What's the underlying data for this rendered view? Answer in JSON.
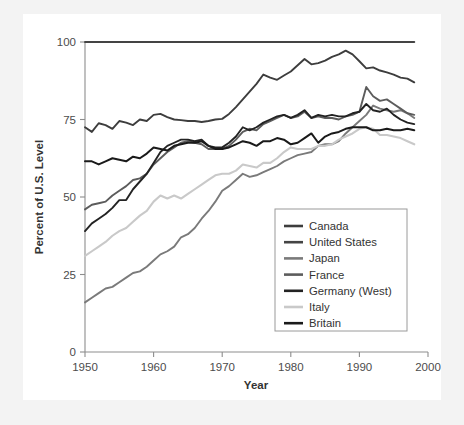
{
  "chart_data": {
    "type": "line",
    "title": "",
    "xlabel": "Year",
    "ylabel": "Percent of U.S. Level",
    "xlim": [
      1950,
      2000
    ],
    "ylim": [
      0,
      100
    ],
    "xticks": [
      1950,
      1960,
      1970,
      1980,
      1990,
      2000
    ],
    "xtick_labels": [
      "1950",
      "1960",
      "1970",
      "1980",
      "1990",
      "2000"
    ],
    "yticks": [
      0,
      25,
      50,
      75,
      100
    ],
    "ytick_labels": [
      "0",
      "25",
      "50",
      "75",
      "100"
    ],
    "grid": false,
    "legend_position": "lower-right-inside",
    "x": [
      1950,
      1951,
      1952,
      1953,
      1954,
      1955,
      1956,
      1957,
      1958,
      1959,
      1960,
      1961,
      1962,
      1963,
      1964,
      1965,
      1966,
      1967,
      1968,
      1969,
      1970,
      1971,
      1972,
      1973,
      1974,
      1975,
      1976,
      1977,
      1978,
      1979,
      1980,
      1981,
      1982,
      1983,
      1984,
      1985,
      1986,
      1987,
      1988,
      1989,
      1990,
      1991,
      1992,
      1993,
      1994,
      1995,
      1996,
      1997,
      1998
    ],
    "series": [
      {
        "name": "Canada",
        "color": "#3d3d3d",
        "values": [
          72.5,
          71.0,
          73.8,
          73.2,
          72.0,
          74.5,
          74.0,
          73.2,
          75.0,
          74.5,
          76.5,
          76.8,
          75.8,
          75.0,
          74.8,
          74.5,
          74.5,
          74.2,
          74.5,
          75.0,
          75.2,
          76.8,
          79.0,
          81.5,
          84.0,
          86.5,
          89.5,
          88.5,
          87.8,
          89.2,
          90.5,
          92.5,
          94.5,
          92.8,
          93.2,
          94.0,
          95.2,
          96.0,
          97.2,
          96.0,
          93.8,
          91.5,
          91.8,
          90.8,
          90.2,
          89.5,
          88.5,
          88.2,
          87.0
        ]
      },
      {
        "name": "United States",
        "color": "#444444",
        "values": [
          100,
          100,
          100,
          100,
          100,
          100,
          100,
          100,
          100,
          100,
          100,
          100,
          100,
          100,
          100,
          100,
          100,
          100,
          100,
          100,
          100,
          100,
          100,
          100,
          100,
          100,
          100,
          100,
          100,
          100,
          100,
          100,
          100,
          100,
          100,
          100,
          100,
          100,
          100,
          100,
          100,
          100,
          100,
          100,
          100,
          100,
          100,
          100,
          100
        ]
      },
      {
        "name": "Japan",
        "color": "#7a7a7a",
        "values": [
          16.0,
          17.5,
          19.0,
          20.5,
          21.0,
          22.5,
          24.0,
          25.5,
          26.0,
          27.5,
          29.5,
          31.5,
          32.5,
          34.0,
          37.0,
          38.0,
          40.0,
          43.0,
          45.5,
          48.5,
          52.0,
          53.5,
          55.5,
          57.5,
          56.5,
          57.0,
          58.0,
          59.0,
          60.0,
          61.5,
          62.5,
          63.5,
          64.0,
          64.5,
          66.5,
          67.0,
          67.0,
          68.0,
          70.5,
          72.5,
          74.5,
          76.5,
          79.5,
          78.5,
          78.0,
          77.5,
          78.0,
          77.0,
          75.5
        ]
      },
      {
        "name": "France",
        "color": "#5c5c5c",
        "values": [
          46.0,
          47.5,
          48.0,
          48.5,
          50.5,
          52.0,
          53.5,
          55.5,
          56.0,
          57.5,
          60.5,
          62.5,
          64.5,
          66.0,
          67.5,
          68.0,
          67.5,
          67.0,
          65.5,
          65.5,
          65.5,
          66.5,
          68.5,
          71.0,
          72.0,
          71.5,
          73.5,
          74.5,
          75.5,
          76.5,
          75.5,
          76.0,
          77.5,
          75.5,
          76.0,
          75.5,
          75.5,
          75.0,
          76.0,
          76.5,
          77.5,
          85.5,
          82.5,
          81.0,
          81.5,
          80.0,
          78.5,
          77.0,
          76.5
        ]
      },
      {
        "name": "Germany (West)",
        "color": "#232323",
        "values": [
          39.0,
          41.5,
          43.0,
          44.5,
          46.5,
          49.0,
          49.0,
          52.5,
          55.0,
          57.5,
          61.0,
          64.5,
          66.5,
          67.5,
          68.5,
          68.5,
          68.0,
          68.5,
          66.5,
          66.0,
          66.0,
          67.5,
          69.5,
          72.5,
          71.5,
          72.5,
          74.0,
          75.0,
          76.0,
          76.5,
          75.5,
          76.5,
          78.0,
          75.5,
          76.5,
          76.0,
          76.5,
          76.0,
          76.0,
          77.0,
          77.5,
          80.0,
          78.0,
          77.5,
          78.5,
          76.5,
          75.0,
          74.0,
          73.5
        ]
      },
      {
        "name": "Italy",
        "color": "#c9c9c9",
        "values": [
          31.0,
          32.5,
          34.0,
          35.5,
          37.5,
          39.0,
          40.0,
          42.0,
          44.0,
          45.5,
          48.5,
          50.5,
          49.5,
          50.5,
          49.5,
          51.0,
          52.5,
          54.0,
          55.5,
          57.0,
          57.5,
          57.5,
          58.5,
          60.5,
          60.0,
          59.5,
          61.0,
          61.0,
          62.5,
          64.5,
          66.0,
          65.5,
          65.5,
          65.5,
          66.5,
          66.5,
          67.0,
          68.5,
          69.5,
          70.5,
          72.0,
          72.5,
          72.0,
          70.0,
          70.0,
          69.5,
          69.0,
          68.0,
          67.0
        ]
      },
      {
        "name": "Britain",
        "color": "#1a1a1a",
        "values": [
          61.5,
          61.5,
          60.5,
          61.5,
          62.5,
          62.0,
          61.5,
          63.0,
          62.5,
          64.0,
          66.0,
          65.5,
          65.0,
          66.5,
          67.0,
          67.5,
          67.5,
          68.0,
          66.5,
          65.5,
          65.5,
          66.0,
          67.0,
          68.0,
          67.5,
          66.5,
          68.0,
          68.0,
          69.0,
          68.5,
          67.0,
          67.5,
          69.0,
          70.5,
          67.5,
          69.5,
          70.5,
          71.0,
          72.0,
          72.5,
          72.5,
          72.5,
          71.5,
          71.5,
          72.0,
          71.5,
          71.5,
          72.0,
          71.5
        ]
      }
    ]
  },
  "legend": {
    "items": [
      {
        "label": "Canada"
      },
      {
        "label": "United States"
      },
      {
        "label": "Japan"
      },
      {
        "label": "France"
      },
      {
        "label": "Germany (West)"
      },
      {
        "label": "Italy"
      },
      {
        "label": "Britain"
      }
    ]
  }
}
